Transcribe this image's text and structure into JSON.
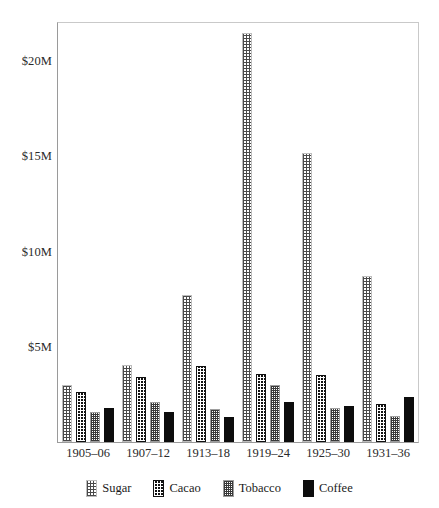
{
  "chart_data": {
    "type": "bar",
    "title": "",
    "subtitle": "",
    "xlabel": "",
    "ylabel": "",
    "grid": false,
    "legend_position": "bottom",
    "categories": [
      "1905–06",
      "1907–12",
      "1913–18",
      "1919–24",
      "1925–30",
      "1931–36"
    ],
    "ylim": [
      0,
      22
    ],
    "yticks": [
      5,
      10,
      15,
      20
    ],
    "ytick_labels": [
      "$5M",
      "$10M",
      "$15M",
      "$20M"
    ],
    "value_unit": "USD millions",
    "series": [
      {
        "name": "Sugar",
        "pattern": "light-dotted",
        "color": "#4a4a4a",
        "values": [
          3.0,
          4.05,
          7.7,
          21.5,
          15.2,
          8.7
        ]
      },
      {
        "name": "Cacao",
        "pattern": "dense-checker",
        "color": "#111111",
        "values": [
          2.65,
          3.4,
          4.0,
          3.55,
          3.5,
          2.0
        ]
      },
      {
        "name": "Tobacco",
        "pattern": "medium-dotted",
        "color": "#3a3a3a",
        "values": [
          1.55,
          2.1,
          1.75,
          3.0,
          1.8,
          1.35
        ]
      },
      {
        "name": "Coffee",
        "pattern": "solid",
        "color": "#0d0d0d",
        "values": [
          1.8,
          1.55,
          1.3,
          2.1,
          1.9,
          2.35
        ]
      }
    ]
  },
  "axes": {
    "y_axis_name": "value-axis",
    "x_axis_name": "period-axis"
  }
}
